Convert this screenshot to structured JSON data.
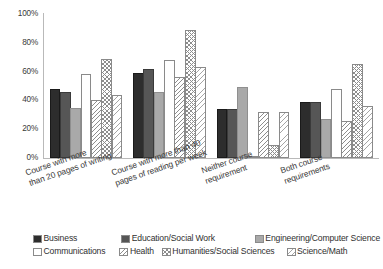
{
  "chart_data": {
    "type": "bar",
    "title": "",
    "xlabel": "",
    "ylabel": "",
    "ylim": [
      0,
      100
    ],
    "grid": false,
    "legend_position": "bottom",
    "y_ticks": [
      "0%",
      "20%",
      "40%",
      "60%",
      "80%",
      "100%"
    ],
    "y_tick_values": [
      0,
      20,
      40,
      60,
      80,
      100
    ],
    "categories": [
      "Course with more\nthan 20 pages of writing",
      "Course with more than 40\npages of reading per week",
      "Neither course\nrequirement",
      "Both course\nrequirements"
    ],
    "series": [
      {
        "name": "Business",
        "values": [
          48,
          59,
          34,
          39
        ],
        "color": "#2d2d2d",
        "pattern": "solid"
      },
      {
        "name": "Education/Social Work",
        "values": [
          46,
          62,
          34,
          39
        ],
        "color": "#565656",
        "pattern": "solid"
      },
      {
        "name": "Engineering/Computer Science",
        "values": [
          35,
          46,
          49,
          27
        ],
        "color": "#a9a9a9",
        "pattern": "solid"
      },
      {
        "name": "Communications",
        "values": [
          58,
          68,
          0,
          48
        ],
        "color": "#ffffff",
        "pattern": "open"
      },
      {
        "name": "Health",
        "values": [
          40,
          56,
          32,
          26
        ],
        "color": "#ffffff",
        "pattern": "diagonal-hatch"
      },
      {
        "name": "Humanities/Social Sciences",
        "values": [
          69,
          89,
          9,
          65
        ],
        "color": "#ffffff",
        "pattern": "cross-hatch"
      },
      {
        "name": "Science/Math",
        "values": [
          44,
          63,
          32,
          36
        ],
        "color": "#ffffff",
        "pattern": "light-diagonal-hatch"
      }
    ]
  },
  "legend": {
    "rows": [
      [
        {
          "label": "Business",
          "swatch": "legend-swatch-business"
        },
        {
          "label": "Education/Social Work",
          "swatch": "legend-swatch-education"
        },
        {
          "label": "Engineering/Computer Science",
          "swatch": "legend-swatch-engineering"
        }
      ],
      [
        {
          "label": "Communications",
          "swatch": "legend-swatch-communications"
        },
        {
          "label": "Health",
          "swatch": "legend-swatch-health"
        },
        {
          "label": "Humanities/Social Sciences",
          "swatch": "legend-swatch-humanities"
        },
        {
          "label": "Science/Math",
          "swatch": "legend-swatch-sciencemath"
        }
      ]
    ]
  }
}
